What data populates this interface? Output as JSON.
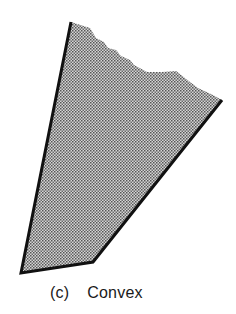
{
  "figure": {
    "shape": "convex-polygon",
    "fill_pattern": "stipple-dots",
    "fill_color": "#c9c9c9",
    "dot_color": "#5a5a5a",
    "edge_color": "#111111",
    "vertices": [
      [
        71,
        22
      ],
      [
        90,
        28
      ],
      [
        96,
        38
      ],
      [
        104,
        42
      ],
      [
        108,
        48
      ],
      [
        116,
        50
      ],
      [
        121,
        56
      ],
      [
        130,
        60
      ],
      [
        134,
        65
      ],
      [
        147,
        72
      ],
      [
        162,
        72
      ],
      [
        176,
        71
      ],
      [
        190,
        82
      ],
      [
        198,
        88
      ],
      [
        213,
        95
      ],
      [
        222,
        100
      ],
      [
        93,
        262
      ],
      [
        21,
        273
      ]
    ],
    "bold_edges": [
      [
        [
          71,
          22
        ],
        [
          21,
          273
        ]
      ],
      [
        [
          21,
          273
        ],
        [
          93,
          262
        ]
      ],
      [
        [
          93,
          262
        ],
        [
          222,
          100
        ]
      ]
    ]
  },
  "caption": {
    "tag": "(c)",
    "title": "Convex"
  }
}
